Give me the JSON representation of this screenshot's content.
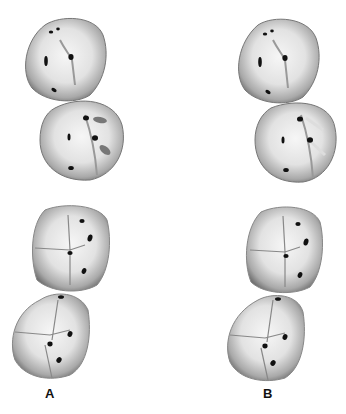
{
  "figure": {
    "panels": [
      {
        "id": "A",
        "label": "A"
      },
      {
        "id": "B",
        "label": "B"
      }
    ]
  },
  "colors": {
    "tooth_fill_light": "#f4f4f4",
    "tooth_fill_mid": "#c8c8c8",
    "tooth_shadow": "#7a7a7a",
    "pit": "#111111"
  }
}
